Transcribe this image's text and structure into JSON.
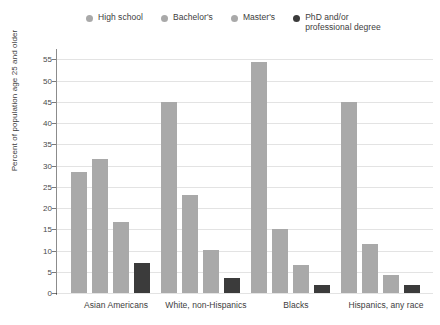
{
  "chart_data": {
    "type": "bar",
    "title": "",
    "subtitle": "",
    "xlabel": "",
    "ylabel": "Percent of population age 25 and older",
    "ylim": [
      0,
      57
    ],
    "yticks": [
      0,
      5,
      10,
      15,
      20,
      25,
      30,
      35,
      40,
      45,
      50,
      55
    ],
    "grid": true,
    "legend_position": "top",
    "categories": [
      "Asian Americans",
      "White, non-Hispanics",
      "Blacks",
      "Hispanics, any race"
    ],
    "series": [
      {
        "name": "High school",
        "color": "#a9a9a9",
        "values": [
          28.6,
          45.0,
          54.5,
          45.0
        ]
      },
      {
        "name": "Bachelor's",
        "color": "#a9a9a9",
        "values": [
          31.6,
          23.2,
          15.0,
          11.6
        ]
      },
      {
        "name": "Master's",
        "color": "#a9a9a9",
        "values": [
          16.8,
          10.2,
          6.6,
          4.3
        ]
      },
      {
        "name": "PhD and/or professional degree",
        "color": "#3b3b3b",
        "values": [
          7.0,
          3.6,
          2.0,
          1.8
        ]
      }
    ]
  },
  "legend": {
    "items": [
      {
        "label": "High school",
        "color": "#a9a9a9"
      },
      {
        "label": "Bachelor's",
        "color": "#a9a9a9"
      },
      {
        "label": "Master's",
        "color": "#a9a9a9"
      },
      {
        "label": "PhD and/or\nprofessional degree",
        "color": "#3b3b3b"
      }
    ]
  },
  "colors": {
    "bar_light": "#a9a9a9",
    "bar_dark": "#3b3b3b",
    "gridline": "#e3e3e3",
    "axis": "#4a4a4a",
    "text": "#3d3d3d",
    "background": "#ffffff"
  }
}
